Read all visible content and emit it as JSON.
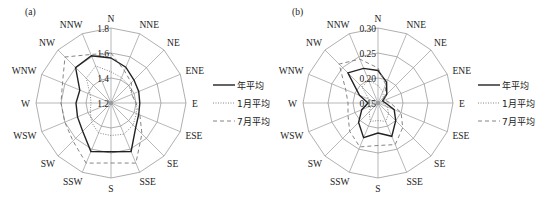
{
  "chart_data": [
    {
      "type": "radar",
      "panel_label": "(a)",
      "title": "",
      "categories": [
        "N",
        "NNE",
        "NE",
        "ENE",
        "E",
        "ESE",
        "SE",
        "SSE",
        "S",
        "SSW",
        "SW",
        "WSW",
        "W",
        "WNW",
        "NW",
        "NNW"
      ],
      "radial_ticks": [
        "1.2",
        "1.4",
        "1.6",
        "1.8"
      ],
      "radial_tick_values": [
        1.2,
        1.4,
        1.6,
        1.8
      ],
      "rlim": [
        1.2,
        1.8
      ],
      "grid": true,
      "legend_position": "right",
      "series": [
        {
          "name": "年平均",
          "style": "solid",
          "values": [
            1.56,
            1.51,
            1.46,
            1.44,
            1.43,
            1.44,
            1.48,
            1.62,
            1.59,
            1.62,
            1.52,
            1.49,
            1.48,
            1.47,
            1.6,
            1.61
          ]
        },
        {
          "name": "1月平均",
          "style": "dotted",
          "values": [
            1.45,
            1.42,
            1.4,
            1.38,
            1.4,
            1.42,
            1.45,
            1.47,
            1.46,
            1.46,
            1.42,
            1.38,
            1.36,
            1.38,
            1.48,
            1.52
          ]
        },
        {
          "name": "7月平均",
          "style": "dashed",
          "values": [
            1.6,
            1.48,
            1.43,
            1.38,
            1.4,
            1.45,
            1.55,
            1.72,
            1.68,
            1.72,
            1.63,
            1.6,
            1.6,
            1.62,
            1.72,
            1.62
          ]
        }
      ]
    },
    {
      "type": "radar",
      "panel_label": "(b)",
      "title": "",
      "categories": [
        "N",
        "NNE",
        "NE",
        "ENE",
        "E",
        "ESE",
        "SE",
        "SSE",
        "S",
        "SSW",
        "SW",
        "WSW",
        "W",
        "WNW",
        "NW",
        "NNW"
      ],
      "radial_ticks": [
        "0.15",
        "0.20",
        "0.25",
        "0.30"
      ],
      "radial_tick_values": [
        0.15,
        0.2,
        0.25,
        0.3
      ],
      "rlim": [
        0.15,
        0.3
      ],
      "grid": true,
      "legend_position": "right",
      "series": [
        {
          "name": "年平均",
          "style": "solid",
          "values": [
            0.215,
            0.195,
            0.175,
            0.16,
            0.165,
            0.185,
            0.2,
            0.222,
            0.21,
            0.225,
            0.205,
            0.185,
            0.17,
            0.19,
            0.235,
            0.225
          ]
        },
        {
          "name": "1月平均",
          "style": "dotted",
          "values": [
            0.185,
            0.175,
            0.165,
            0.16,
            0.16,
            0.17,
            0.18,
            0.19,
            0.185,
            0.19,
            0.175,
            0.165,
            0.16,
            0.17,
            0.195,
            0.2
          ]
        },
        {
          "name": "7月平均",
          "style": "dashed",
          "values": [
            0.22,
            0.19,
            0.17,
            0.165,
            0.175,
            0.2,
            0.22,
            0.24,
            0.235,
            0.245,
            0.23,
            0.215,
            0.21,
            0.22,
            0.26,
            0.245
          ]
        }
      ]
    }
  ],
  "layout": {
    "panels": [
      {
        "cx": 111,
        "cy": 103,
        "radius": 75,
        "legend_x": 213,
        "legend_y": 85
      },
      {
        "cx": 378,
        "cy": 103,
        "radius": 75,
        "legend_x": 478,
        "legend_y": 85
      }
    ],
    "colors": {
      "grid": "#9a9a9a",
      "series": "#222222",
      "dashed": "#777777",
      "dotted": "#777777"
    }
  }
}
